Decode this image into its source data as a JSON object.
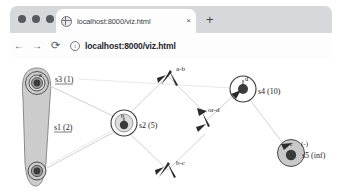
{
  "browser": {
    "tab": {
      "title": "localhost:8000/viz.html",
      "favicon_icon": "globe-icon",
      "close_icon": "×"
    },
    "new_tab_icon": "+",
    "toolbar": {
      "back_icon": "←",
      "forward_icon": "→",
      "reload_icon": "⟳",
      "site_info_icon": "ⓘ",
      "url": "localhost:8000/viz.html"
    },
    "traffic_lights": [
      "close",
      "minimize",
      "maximize"
    ]
  },
  "graph": {
    "nodes": [
      {
        "id": "s3",
        "glyph": "a",
        "label": "s3 (1)",
        "cx": 37,
        "cy": 25,
        "r": 11,
        "selected": true
      },
      {
        "id": "s1",
        "glyph": "",
        "label": "s1 (2)",
        "cx": 37,
        "cy": 113,
        "r": 9,
        "selected": true
      },
      {
        "id": "s2",
        "glyph": "b",
        "label": "s2 (5)",
        "cx": 124,
        "cy": 65,
        "r": 13,
        "selected": false
      },
      {
        "id": "s4",
        "glyph": "d",
        "label": "s4 (10)",
        "cx": 243,
        "cy": 31,
        "r": 13,
        "selected": false
      },
      {
        "id": "s5",
        "glyph": "c",
        "label": "s5 (inf)",
        "cx": 291,
        "cy": 95,
        "r": 13,
        "selected": true,
        "extra_label": "(-)"
      }
    ],
    "edges": [
      {
        "id": "a-b",
        "label": "a-b"
      },
      {
        "id": "b-c",
        "label": "b-c"
      },
      {
        "id": "or-d",
        "label": "or-d"
      }
    ],
    "colors": {
      "node_fill": "#d0d0d0",
      "node_stroke": "#3a3a3a",
      "node_core": "#4a4a4a",
      "edge_stroke": "#cfcfcf",
      "capsule_fill": "#cccccc",
      "background": "#ffffff"
    }
  }
}
